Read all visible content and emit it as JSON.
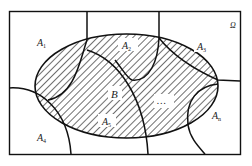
{
  "diagram": {
    "type": "venn-partition",
    "universe_label": "Ω",
    "event_B_label": "B",
    "ellipsis": "…",
    "partitions": [
      {
        "name": "A",
        "sub": "1"
      },
      {
        "name": "A",
        "sub": "2"
      },
      {
        "name": "A",
        "sub": "3"
      },
      {
        "name": "A",
        "sub": "4"
      },
      {
        "name": "A",
        "sub": "5"
      },
      {
        "name": "A",
        "sub": "n"
      }
    ],
    "colors": {
      "stroke": "#111111",
      "hatch": "#222222",
      "background": "#ffffff"
    }
  }
}
